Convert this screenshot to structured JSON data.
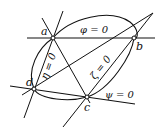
{
  "diagram": {
    "points": [
      {
        "id": "a",
        "label": "a",
        "x": 53,
        "y": 38
      },
      {
        "id": "b",
        "label": "b",
        "x": 134,
        "y": 38
      },
      {
        "id": "c",
        "label": "c",
        "x": 87,
        "y": 97
      },
      {
        "id": "d",
        "label": "d",
        "x": 34,
        "y": 89
      }
    ],
    "lines": [
      {
        "id": "phi",
        "label": "φ = 0"
      },
      {
        "id": "psi",
        "label": "ψ = 0"
      },
      {
        "id": "eta",
        "label": "η = 0"
      },
      {
        "id": "zeta",
        "label": "ζ = 0"
      }
    ],
    "stroke_color": "#111111"
  }
}
